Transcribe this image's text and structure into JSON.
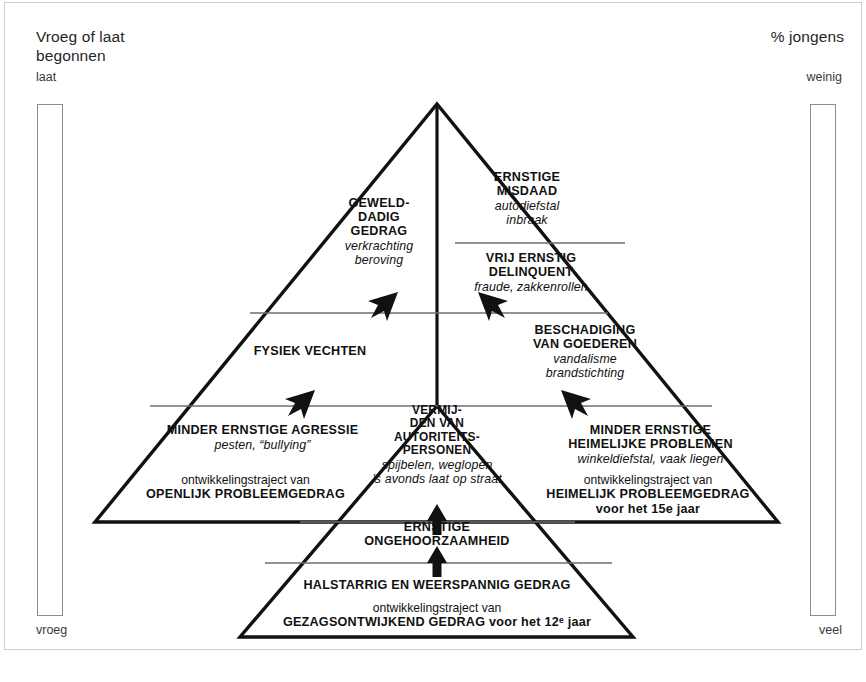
{
  "axes": {
    "left": {
      "title": "Vroeg of laat\nbegonnen",
      "top_label": "laat",
      "bottom_label": "vroeg"
    },
    "right": {
      "title": "% jongens",
      "top_label": "weinig",
      "bottom_label": "veel"
    }
  },
  "pyramid": {
    "levels": [
      {
        "id": "overt-severe",
        "side": "left",
        "heading": "GEWELD-\nDADIG\nGEDRAG",
        "examples": "verkrachting\nberoving"
      },
      {
        "id": "covert-severe",
        "side": "right",
        "heading": "ERNSTIGE\nMISDAAD",
        "examples": "autodiefstal\ninbraak"
      },
      {
        "id": "covert-fairly-severe",
        "side": "right",
        "heading": "VRIJ ERNSTIG\nDELINQUENT",
        "examples": "fraude, zakkenrollen"
      },
      {
        "id": "overt-fighting",
        "side": "left",
        "heading": "FYSIEK VECHTEN",
        "examples": ""
      },
      {
        "id": "covert-property",
        "side": "right",
        "heading": "BESCHADIGING\nVAN GOEDEREN",
        "examples": "vandalisme\nbrandstichting"
      },
      {
        "id": "overt-minor",
        "side": "left",
        "heading": "MINDER ERNSTIGE AGRESSIE",
        "examples": "pesten, “bullying”"
      },
      {
        "id": "authority-avoidance",
        "side": "center",
        "heading": "VERMIJ-\nDEN VAN\nAUTORITEITS-\nPERSONEN",
        "examples": "spijbelen, weglopen\n’s avonds laat op straat"
      },
      {
        "id": "covert-minor",
        "side": "right",
        "heading": "MINDER ERNSTIGE\nHEIMELIJKE PROBLEMEN",
        "examples": "winkeldiefstal, vaak liegen"
      },
      {
        "id": "authority-disobedience",
        "side": "center",
        "heading": "ERNSTIGE\nONGEHOORZAAMHEID",
        "examples": ""
      },
      {
        "id": "authority-stubborn",
        "side": "center",
        "heading": "HALSTARRIG EN WEERSPANNIG GEDRAG",
        "examples": ""
      }
    ],
    "pathways": [
      {
        "id": "overt-pathway",
        "lead": "ontwikkelingstraject van",
        "name": "OPENLIJK PROBLEEMGEDRAG",
        "age": ""
      },
      {
        "id": "covert-pathway",
        "lead": "ontwikkelingstraject van",
        "name": "HEIMELIJK PROBLEEMGEDRAG",
        "age": "voor het 15e jaar"
      },
      {
        "id": "authority-pathway",
        "lead": "ontwikkelingstraject van",
        "name": "GEZAGSONTWIJKEND GEDRAG voor het 12ᵉ jaar",
        "age": ""
      }
    ],
    "arrows": [
      {
        "id": "arrow-overt-upper",
        "direction": "up-right"
      },
      {
        "id": "arrow-covert-upper",
        "direction": "up-left"
      },
      {
        "id": "arrow-overt-lower",
        "direction": "up-right"
      },
      {
        "id": "arrow-covert-lower",
        "direction": "up-left"
      },
      {
        "id": "arrow-authority-mid",
        "direction": "up"
      },
      {
        "id": "arrow-authority-lower",
        "direction": "up"
      }
    ]
  },
  "caption": {
    "text": ""
  },
  "colors": {
    "ink": "#111111",
    "rule": "#6e6e6e",
    "frame": "#cfcfcf",
    "axis_text": "#262626"
  }
}
